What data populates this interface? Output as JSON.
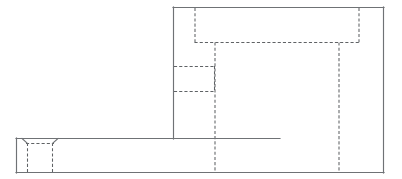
{
  "drawing": {
    "title": "",
    "view_type": "orthographic-elevation",
    "line_styles": {
      "visible_edge_color": "#6f7275",
      "hidden_edge_color": "#5f6265",
      "background_color": "#ffffff",
      "visible_edge_width": 1.15,
      "hidden_edge_width": 1.05,
      "hidden_dash_pattern": "3.1 2.1"
    },
    "canvas": {
      "width": 402,
      "height": 179
    },
    "geometry": {
      "upper_block": {
        "name": "upper-vertical-block",
        "outline": "M 173.5 7.5 L 383.5 7.5 L 383.5 172.5 L 173.5 172.5 Z",
        "top_edge_y": 7.5,
        "left_edge_x": 173.5,
        "right_edge_x": 383.5,
        "bottom_edge_y": 172.5
      },
      "lower_block": {
        "name": "lower-horizontal-base",
        "outline": "M 16.5 138.5 L 383.5 138.5 L 383.5 172.5 L 16.5 172.5 Z",
        "top_edge_y": 138.5,
        "left_edge_x": 16.5,
        "right_edge_x": 383.5,
        "bottom_edge_y": 172.5
      },
      "visible_edges": [
        {
          "name": "upper-block-top-edge",
          "d": "M 173.0 7.5 L 384.0 7.5"
        },
        {
          "name": "upper-block-right-edge",
          "d": "M 383.5 7.0 L 383.5 173.0"
        },
        {
          "name": "upper-block-left-edge",
          "d": "M 173.5 7.0 L 173.5 139.0"
        },
        {
          "name": "base-top-edge-left",
          "d": "M 16.0 138.5 L 173.5 138.5"
        },
        {
          "name": "base-top-edge-right",
          "d": "M 173.5 138.5 L 280.0 138.5"
        },
        {
          "name": "base-left-edge",
          "d": "M 16.5 138.0 L 16.5 173.0"
        },
        {
          "name": "base-bottom-edge",
          "d": "M 16.0 172.5 L 384.0 172.5"
        },
        {
          "name": "notch-chamfer-left",
          "d": "M 22.0 138.5 L 27.5 143.5"
        },
        {
          "name": "notch-chamfer-right",
          "d": "M 52.5 143.5 L 58.0 138.5"
        },
        {
          "name": "notch-left-wall-visible",
          "d": "M 27.5 143.5 L 27.5 172.5"
        },
        {
          "name": "notch-right-wall-visible",
          "d": "M 52.5 143.5 L 52.5 172.5"
        }
      ],
      "hidden_edges": [
        {
          "name": "hidden-pocket-left-wall-upper",
          "d": "M 195.0 8.0 L 195.0 42.5"
        },
        {
          "name": "hidden-pocket-floor",
          "d": "M 194.5 42.5 L 359.5 42.5"
        },
        {
          "name": "hidden-pocket-right-wall-upper",
          "d": "M 359.0 8.0 L 359.0 42.5"
        },
        {
          "name": "hidden-rib-left-wall-full",
          "d": "M 215.0 42.5 L 215.0 172.0"
        },
        {
          "name": "hidden-rib-right-wall-full",
          "d": "M 339.0 42.5 L 339.0 172.0"
        },
        {
          "name": "hidden-step-upper-shelf",
          "d": "M 174.0 66.5 L 215.5 66.5"
        },
        {
          "name": "hidden-step-lower-shelf",
          "d": "M 174.0 91.5 L 215.5 91.5"
        },
        {
          "name": "hidden-step-riser",
          "d": "M 214.5 66.0 L 214.5 92.0"
        },
        {
          "name": "hidden-notch-left-wall",
          "d": "M 27.5 143.0 L 27.5 172.0"
        },
        {
          "name": "hidden-notch-right-wall",
          "d": "M 52.5 143.0 L 52.5 172.0"
        },
        {
          "name": "hidden-notch-floor",
          "d": "M 26.0 143.5 L 54.0 143.5"
        }
      ]
    }
  }
}
